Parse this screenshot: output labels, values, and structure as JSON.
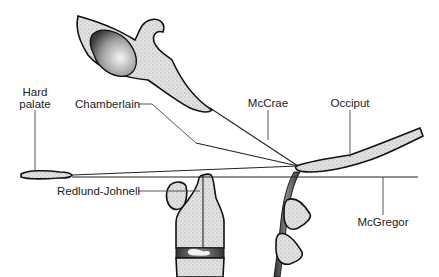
{
  "diagram": {
    "type": "anatomical line diagram",
    "labels": {
      "hard_palate_line1": "Hard",
      "hard_palate_line2": "palate",
      "chamberlain": "Chamberlain",
      "mccrae": "McCrae",
      "occiput": "Occiput",
      "mcgregor": "McGregor",
      "redlund_johnell": "Redlund-Johnell"
    },
    "colors": {
      "outline": "#111111",
      "bone_fill": "#d8d8d8",
      "background": "#ffffff"
    }
  }
}
